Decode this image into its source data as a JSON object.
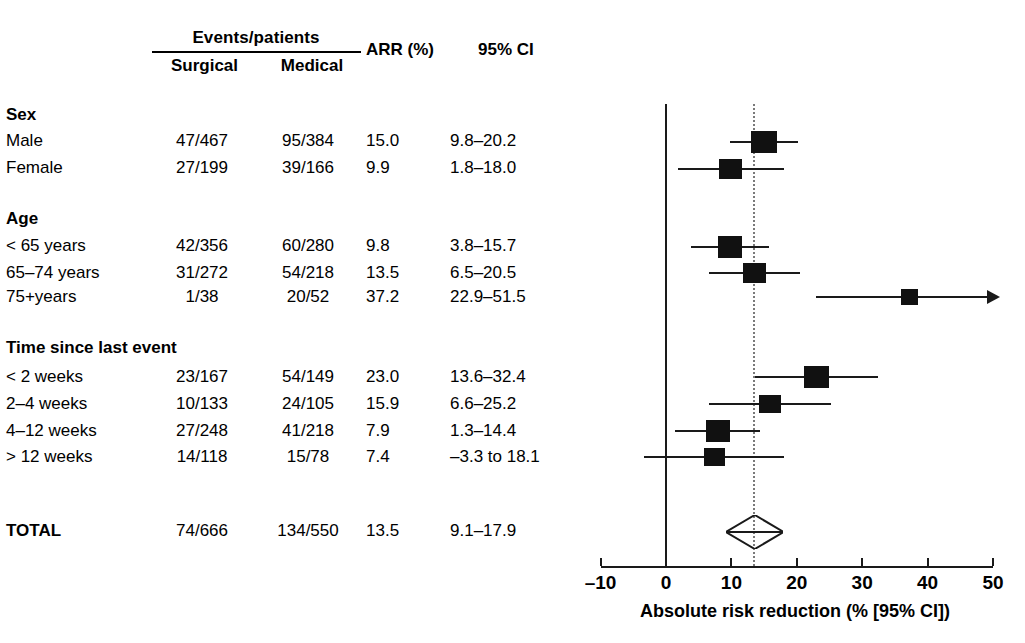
{
  "figure": {
    "type": "forest-plot",
    "axis_title": "Absolute risk reduction (% [95% CI])"
  },
  "table": {
    "header": {
      "events_patients": "Events/patients",
      "surgical": "Surgical",
      "medical": "Medical",
      "arr": "ARR (%)",
      "ci": "95% CI"
    },
    "groups": [
      {
        "title": "Sex",
        "rows": [
          {
            "label": "Male",
            "surgical": "47/467",
            "medical": "95/384",
            "arr": "15.0",
            "ci": "9.8–20.2"
          },
          {
            "label": "Female",
            "surgical": "27/199",
            "medical": "39/166",
            "arr": "9.9",
            "ci": "1.8–18.0"
          }
        ]
      },
      {
        "title": "Age",
        "rows": [
          {
            "label": "< 65 years",
            "surgical": "42/356",
            "medical": "60/280",
            "arr": "9.8",
            "ci": "3.8–15.7"
          },
          {
            "label": "65–74 years",
            "surgical": "31/272",
            "medical": "54/218",
            "arr": "13.5",
            "ci": "6.5–20.5"
          },
          {
            "label": "75+years",
            "surgical": "1/38",
            "medical": "20/52",
            "arr": "37.2",
            "ci": "22.9–51.5"
          }
        ]
      },
      {
        "title": "Time since last event",
        "rows": [
          {
            "label": "< 2 weeks",
            "surgical": "23/167",
            "medical": "54/149",
            "arr": "23.0",
            "ci": "13.6–32.4"
          },
          {
            "label": "2–4 weeks",
            "surgical": "10/133",
            "medical": "24/105",
            "arr": "15.9",
            "ci": "6.6–25.2"
          },
          {
            "label": "4–12 weeks",
            "surgical": "27/248",
            "medical": "41/218",
            "arr": "7.9",
            "ci": "1.3–14.4"
          },
          {
            "label": "> 12 weeks",
            "surgical": "14/118",
            "medical": "15/78",
            "arr": "7.4",
            "ci": "–3.3 to 18.1"
          }
        ]
      }
    ],
    "total": {
      "label": "TOTAL",
      "surgical": "74/666",
      "medical": "134/550",
      "arr": "13.5",
      "ci": "9.1–17.9"
    }
  },
  "chart_data": {
    "type": "forest",
    "title": "",
    "xlabel": "Absolute risk reduction (% [95% CI])",
    "ylabel": "",
    "xlim": [
      -10,
      50
    ],
    "xticks": [
      -10,
      0,
      10,
      20,
      30,
      40,
      50
    ],
    "xticklabels": [
      "–10",
      "0",
      "10",
      "20",
      "30",
      "40",
      "50"
    ],
    "grid": false,
    "legend": null,
    "null_line": 0,
    "reference_line": 13.5,
    "points": [
      {
        "label": "Male",
        "estimate": 15.0,
        "ci_low": 9.8,
        "ci_high": 20.2,
        "weight": 1.0,
        "truncated_high": false
      },
      {
        "label": "Female",
        "estimate": 9.9,
        "ci_low": 1.8,
        "ci_high": 18.0,
        "weight": 0.62,
        "truncated_high": false
      },
      {
        "label": "< 65 years",
        "estimate": 9.8,
        "ci_low": 3.8,
        "ci_high": 15.7,
        "weight": 0.78,
        "truncated_high": false
      },
      {
        "label": "65–74 years",
        "estimate": 13.5,
        "ci_low": 6.5,
        "ci_high": 20.5,
        "weight": 0.72,
        "truncated_high": false
      },
      {
        "label": "75+years",
        "estimate": 37.2,
        "ci_low": 22.9,
        "ci_high": 51.5,
        "weight": 0.2,
        "truncated_high": true
      },
      {
        "label": "< 2 weeks",
        "estimate": 23.0,
        "ci_low": 13.6,
        "ci_high": 32.4,
        "weight": 0.92,
        "truncated_high": false
      },
      {
        "label": "2–4 weeks",
        "estimate": 15.9,
        "ci_low": 6.6,
        "ci_high": 25.2,
        "weight": 0.48,
        "truncated_high": false
      },
      {
        "label": "4–12 weeks",
        "estimate": 7.9,
        "ci_low": 1.3,
        "ci_high": 14.4,
        "weight": 0.76,
        "truncated_high": false
      },
      {
        "label": "> 12 weeks",
        "estimate": 7.4,
        "ci_low": -3.3,
        "ci_high": 18.1,
        "weight": 0.44,
        "truncated_high": false
      }
    ],
    "summary": {
      "label": "TOTAL",
      "estimate": 13.5,
      "ci_low": 9.1,
      "ci_high": 17.9
    }
  },
  "layout": {
    "row_y": {
      "Male": 142,
      "Female": 169,
      "< 65 years": 247,
      "65–74 years": 273,
      "75+years": 297,
      "< 2 weeks": 377,
      "2–4 weeks": 404,
      "4–12 weeks": 431,
      "> 12 weeks": 457,
      "TOTAL": 532
    },
    "table_rows_y": {
      "Sex": 105,
      "Male": 131,
      "Female": 158,
      "Age": 209,
      "< 65 years": 236,
      "65–74 years": 263,
      "75+years": 287,
      "Time since last event": 338,
      "< 2 weeks": 367,
      "2–4 weeks": 394,
      "4–12 weeks": 421,
      "> 12 weeks": 447,
      "TOTAL": 521
    },
    "x0_px": 666,
    "px_per_unit": 6.54,
    "axis_y": 566,
    "plot_top": 104,
    "plot_bottom": 560
  },
  "colors": {
    "ink": "#111111",
    "line": "#1a1a1a",
    "reference": "#7a7a7a",
    "background": "#ffffff"
  }
}
